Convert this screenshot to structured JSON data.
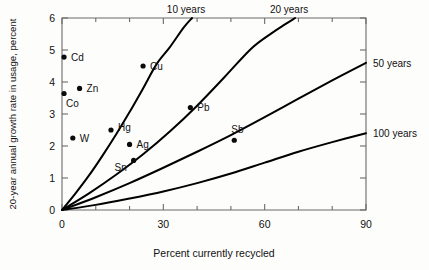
{
  "chart_data": {
    "type": "scatter",
    "title": "",
    "xlabel": "Percent currently recycled",
    "ylabel": "20-year annual growth rate in usage, percent",
    "xlim": [
      0,
      90
    ],
    "ylim": [
      0,
      6
    ],
    "grid": false,
    "legend_position": "inline-curve-labels",
    "xticks": [
      0,
      30,
      60,
      90
    ],
    "xtick_labels": [
      "0",
      "30",
      "60",
      "90"
    ],
    "xminor_ticks": [
      10,
      20,
      40,
      50,
      70,
      80
    ],
    "yticks": [
      0,
      1,
      2,
      3,
      4,
      5,
      6
    ],
    "ytick_labels": [
      "0",
      "1",
      "2",
      "3",
      "4",
      "5",
      "6"
    ],
    "points": [
      {
        "label": "Cd",
        "x": 0.6,
        "y": 4.78,
        "label_dx": 7,
        "label_dy": 3.5
      },
      {
        "label": "Cu",
        "x": 24.0,
        "y": 4.5,
        "label_dx": 7,
        "label_dy": 3.5
      },
      {
        "label": "Zn",
        "x": 5.2,
        "y": 3.8,
        "label_dx": 7,
        "label_dy": 3.5
      },
      {
        "label": "Co",
        "x": 0.6,
        "y": 3.64,
        "label_dx": 2,
        "label_dy": 13
      },
      {
        "label": "Pb",
        "x": 38.0,
        "y": 3.2,
        "label_dx": 7,
        "label_dy": 3.5
      },
      {
        "label": "Hg",
        "x": 14.5,
        "y": 2.5,
        "label_dx": 7,
        "label_dy": 1
      },
      {
        "label": "W",
        "x": 3.2,
        "y": 2.25,
        "label_dx": 7,
        "label_dy": 3.5
      },
      {
        "label": "Sb",
        "x": 51.0,
        "y": 2.18,
        "label_dx": -3,
        "label_dy": -7
      },
      {
        "label": "Ag",
        "x": 20.0,
        "y": 2.05,
        "label_dx": 7,
        "label_dy": 3.5
      },
      {
        "label": "Sn",
        "x": 21.2,
        "y": 1.55,
        "label_dx": -19,
        "label_dy": 11
      }
    ],
    "series": [
      {
        "name": "10 years",
        "label_position": "top",
        "x": [
          0,
          4,
          8,
          12,
          16,
          20,
          24,
          28,
          32,
          36,
          38.5
        ],
        "values": [
          0,
          0.52,
          1.08,
          1.7,
          2.36,
          3.06,
          3.8,
          4.56,
          5.1,
          5.7,
          6.0
        ]
      },
      {
        "name": "20 years",
        "label_position": "top",
        "x": [
          0,
          8,
          16,
          24,
          32,
          40,
          48,
          56,
          62,
          66,
          69
        ],
        "values": [
          0,
          0.52,
          1.1,
          1.74,
          2.46,
          3.26,
          4.14,
          5.04,
          5.52,
          5.8,
          6.0
        ]
      },
      {
        "name": "50 years",
        "label_position": "right",
        "x": [
          0,
          10,
          20,
          30,
          40,
          50,
          60,
          70,
          80,
          90
        ],
        "values": [
          0,
          0.4,
          0.84,
          1.32,
          1.82,
          2.34,
          2.9,
          3.48,
          4.05,
          4.6
        ]
      },
      {
        "name": "100 years",
        "label_position": "right",
        "x": [
          0,
          10,
          20,
          30,
          40,
          50,
          60,
          70,
          80,
          90
        ],
        "values": [
          0,
          0.16,
          0.36,
          0.58,
          0.84,
          1.14,
          1.48,
          1.82,
          2.12,
          2.4
        ]
      }
    ]
  },
  "colors": {
    "curve": "#000000",
    "point": "#0b0b0b",
    "axis": "#6b6b6b",
    "background": "#fdfdfc"
  }
}
